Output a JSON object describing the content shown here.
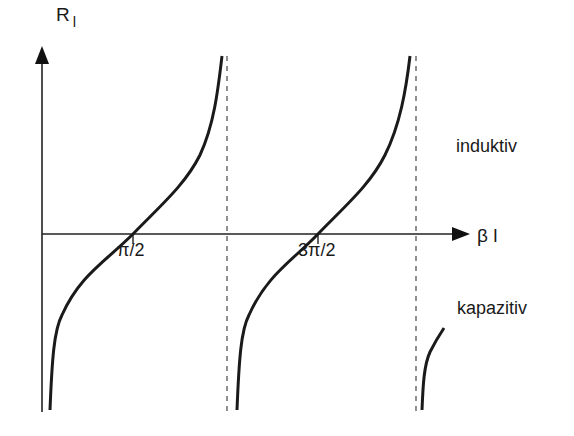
{
  "diagram": {
    "y_axis": {
      "label": "R",
      "subscript": "l"
    },
    "x_axis": {
      "label": "β l"
    },
    "ticks": [
      {
        "label": "π/2"
      },
      {
        "label": "3π/2"
      }
    ],
    "regions": {
      "upper": "induktiv",
      "lower": "kapazitiv"
    },
    "colors": {
      "curve": "#1a1a1a",
      "axis": "#222222",
      "asymptote": "#555555",
      "background": "#ffffff"
    }
  }
}
